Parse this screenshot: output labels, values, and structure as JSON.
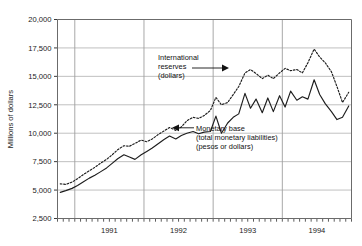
{
  "chart_data": {
    "type": "line",
    "title": "",
    "xlabel": "",
    "ylabel": "Millions of dollars",
    "ylim": [
      2500,
      20000
    ],
    "ytick_labels": [
      "20,000",
      "17,500",
      "15,000",
      "12,500",
      "10,000",
      "7,500",
      "5,000",
      "2,500"
    ],
    "ytick_values": [
      20000,
      17500,
      15000,
      12500,
      10000,
      7500,
      5000,
      2500
    ],
    "xtick_labels": [
      "1991",
      "1992",
      "1993",
      "1994"
    ],
    "xtick_values": [
      1991,
      1992,
      1993,
      1994
    ],
    "xlim": [
      1990.75,
      1995.0
    ],
    "grid": "horizontal-and-yearly-vertical",
    "legend_position": "inline-annotations",
    "minor_ticks": "monthly",
    "series": [
      {
        "name": "International reserves (dollars)",
        "style": "dotted",
        "x": [
          1990.79,
          1990.87,
          1990.96,
          1991.04,
          1991.12,
          1991.21,
          1991.29,
          1991.37,
          1991.46,
          1991.54,
          1991.62,
          1991.71,
          1991.79,
          1991.87,
          1991.96,
          1992.04,
          1992.12,
          1992.21,
          1992.29,
          1992.37,
          1992.46,
          1992.54,
          1992.62,
          1992.71,
          1992.79,
          1992.87,
          1992.96,
          1993.04,
          1993.12,
          1993.21,
          1993.29,
          1993.37,
          1993.46,
          1993.54,
          1993.62,
          1993.71,
          1993.79,
          1993.87,
          1993.96,
          1994.04,
          1994.12,
          1994.21,
          1994.29,
          1994.37,
          1994.46,
          1994.54,
          1994.62,
          1994.71,
          1994.79,
          1994.87,
          1994.96
        ],
        "values": [
          5550,
          5500,
          5700,
          6000,
          6350,
          6700,
          7000,
          7350,
          7700,
          8100,
          8550,
          8900,
          8850,
          9100,
          9400,
          9250,
          9500,
          9900,
          10200,
          10500,
          10250,
          10550,
          11100,
          11400,
          11300,
          11550,
          12000,
          13150,
          12500,
          12700,
          13400,
          14100,
          15300,
          15600,
          15250,
          14800,
          15100,
          14800,
          15300,
          15700,
          15500,
          15600,
          15300,
          16200,
          17400,
          16700,
          16200,
          15400,
          14100,
          12700,
          13600
        ]
      },
      {
        "name": "Monetary base (total monetary liabilities) (pesos or dollars)",
        "style": "solid",
        "x": [
          1990.79,
          1990.87,
          1990.96,
          1991.04,
          1991.12,
          1991.21,
          1991.29,
          1991.37,
          1991.46,
          1991.54,
          1991.62,
          1991.71,
          1991.79,
          1991.87,
          1991.96,
          1992.04,
          1992.12,
          1992.21,
          1992.29,
          1992.37,
          1992.46,
          1992.54,
          1992.62,
          1992.71,
          1992.79,
          1992.87,
          1992.96,
          1993.04,
          1993.12,
          1993.21,
          1993.29,
          1993.37,
          1993.46,
          1993.54,
          1993.62,
          1993.71,
          1993.79,
          1993.87,
          1993.96,
          1994.04,
          1994.12,
          1994.21,
          1994.29,
          1994.37,
          1994.46,
          1994.54,
          1994.62,
          1994.71,
          1994.79,
          1994.87,
          1994.96
        ],
        "values": [
          4800,
          4950,
          5150,
          5400,
          5700,
          6050,
          6300,
          6600,
          6950,
          7350,
          7750,
          8100,
          7900,
          7700,
          8100,
          8400,
          8700,
          9100,
          9450,
          9750,
          9500,
          9800,
          10000,
          10150,
          9950,
          10100,
          10150,
          11500,
          10000,
          10900,
          11400,
          11700,
          13500,
          12200,
          13000,
          11800,
          13100,
          11900,
          13300,
          12300,
          13700,
          12900,
          13200,
          13000,
          14700,
          13400,
          12600,
          11900,
          11200,
          11400,
          12400
        ]
      }
    ],
    "annotations": [
      {
        "name": "international-reserves-annotation",
        "lines": [
          "International",
          "reserves",
          "(dollars)"
        ],
        "arrow": "right"
      },
      {
        "name": "monetary-base-annotation",
        "lines": [
          "Monetary base",
          "(total monetary liabilities)",
          "(pesos or dollars)"
        ],
        "arrow": "left"
      }
    ]
  }
}
